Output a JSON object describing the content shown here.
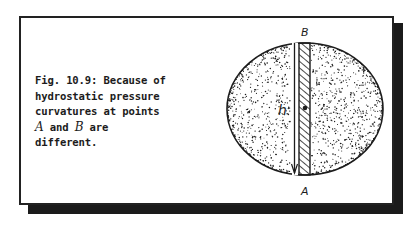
{
  "figure": {
    "caption": {
      "lines": [
        {
          "text": "Fig. 10.9: Because of"
        },
        {
          "text": "hydrostatic pressure"
        },
        {
          "text": "curvatures at points"
        },
        {
          "pre": "",
          "var1": "A",
          "mid": " and ",
          "var2": "B",
          "post": " are"
        },
        {
          "text": "different."
        }
      ]
    },
    "diagram": {
      "label_top": "B",
      "label_bottom": "A",
      "label_height": "h",
      "shape": "stippled ellipse (liquid drop)",
      "elements": [
        "hatched vertical column",
        "height arrow h",
        "center dot"
      ]
    },
    "colors": {
      "ink": "#1c1c1c",
      "shadow": "#1b1b1b",
      "background": "#ffffff"
    }
  }
}
